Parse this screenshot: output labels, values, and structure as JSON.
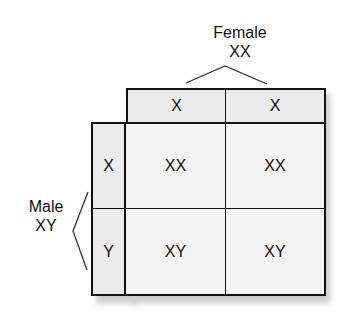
{
  "female": {
    "label": "Female",
    "genotype": "XX"
  },
  "male": {
    "label": "Male",
    "genotype": "XY"
  },
  "columns": [
    "X",
    "X"
  ],
  "rows": [
    "X",
    "Y"
  ],
  "cells": [
    [
      "XX",
      "XX"
    ],
    [
      "XY",
      "XY"
    ]
  ]
}
